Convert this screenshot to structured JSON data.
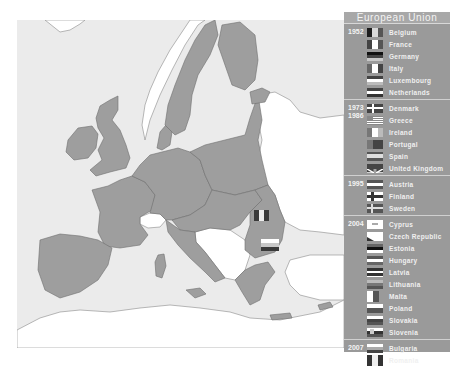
{
  "map": {
    "colors": {
      "sea": "#ebebeb",
      "eu_member": "#9e9e9e",
      "non_member": "#ffffff",
      "border": "#6f6f6f"
    },
    "map_flags": [
      {
        "country": "Romania",
        "x": 255,
        "y": 212
      },
      {
        "country": "Bulgaria",
        "x": 262,
        "y": 240
      }
    ]
  },
  "legend": {
    "title": "European Union",
    "background": "#9a9a9a",
    "groups": [
      {
        "year": "1952",
        "countries": [
          "Belgium",
          "France",
          "Germany",
          "Italy",
          "Luxembourg",
          "Netherlands"
        ]
      },
      {
        "year": "1973 - 1986",
        "year_lines": [
          "1973",
          "1986"
        ],
        "countries": [
          "Denmark",
          "Greece",
          "Ireland",
          "Portugal",
          "Spain",
          "United Kingdom"
        ]
      },
      {
        "year": "1995",
        "countries": [
          "Austria",
          "Finland",
          "Sweden"
        ]
      },
      {
        "year": "2004",
        "countries": [
          "Cyprus",
          "Czech Republic",
          "Estonia",
          "Hungary",
          "Latvia",
          "Lithuania",
          "Malta",
          "Poland",
          "Slovakia",
          "Slovenia"
        ]
      },
      {
        "year": "2007",
        "countries": [
          "Bulgaria",
          "Romania"
        ]
      }
    ]
  }
}
